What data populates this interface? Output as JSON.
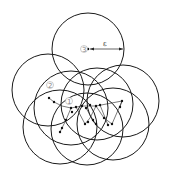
{
  "diagram": {
    "type": "dbscan-neighborhood",
    "labels": {
      "point1": "1",
      "point2": "2",
      "point3": "3",
      "radius": "ε"
    },
    "colors": {
      "stroke": "#1a1a1a",
      "label": "#888888"
    },
    "circles": [
      {
        "cx": 88,
        "cy": 49,
        "r": 36
      },
      {
        "cx": 48,
        "cy": 90,
        "r": 36
      },
      {
        "cx": 71,
        "cy": 108,
        "r": 37
      },
      {
        "cx": 97,
        "cy": 104,
        "r": 36
      },
      {
        "cx": 123,
        "cy": 101,
        "r": 36
      },
      {
        "cx": 60,
        "cy": 127,
        "r": 37
      },
      {
        "cx": 87,
        "cy": 129,
        "r": 36
      },
      {
        "cx": 113,
        "cy": 124,
        "r": 36
      }
    ],
    "points": [
      [
        49,
        98
      ],
      [
        54,
        102
      ],
      [
        71,
        108
      ],
      [
        76,
        107
      ],
      [
        82,
        106
      ],
      [
        86,
        108
      ],
      [
        90,
        105
      ],
      [
        96,
        106
      ],
      [
        100,
        105
      ],
      [
        122,
        101
      ],
      [
        120,
        107
      ],
      [
        72,
        112
      ],
      [
        66,
        120
      ],
      [
        62,
        128
      ],
      [
        60,
        132
      ],
      [
        85,
        124
      ],
      [
        88,
        122
      ],
      [
        93,
        120
      ],
      [
        96,
        124
      ],
      [
        104,
        118
      ],
      [
        108,
        125
      ],
      [
        112,
        124
      ]
    ]
  }
}
